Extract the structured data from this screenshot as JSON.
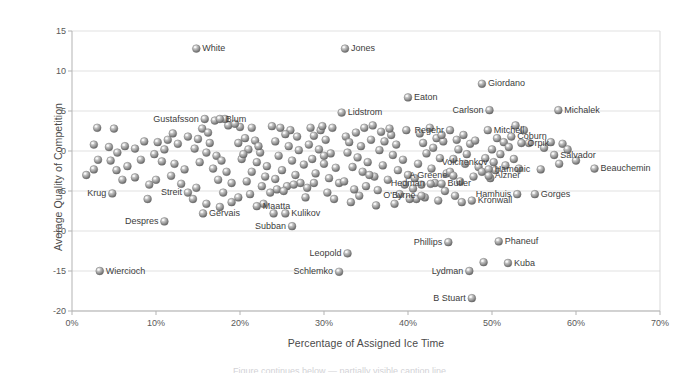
{
  "chart_data": {
    "type": "scatter",
    "title": "",
    "xlabel": "Percentage of Assigned Ice Time",
    "ylabel": "Average Quality of Competition",
    "xlim": [
      0,
      70
    ],
    "ylim": [
      -20,
      15
    ],
    "xtick_labels": [
      "0%",
      "10%",
      "20%",
      "30%",
      "40%",
      "50%",
      "60%",
      "70%"
    ],
    "xtick_values": [
      0,
      10,
      20,
      30,
      40,
      50,
      60,
      70
    ],
    "ytick_labels": [
      "15",
      "10",
      "5",
      "0",
      "-5",
      "-10",
      "-15",
      "-20"
    ],
    "ytick_values": [
      15,
      10,
      5,
      0,
      -5,
      -10,
      -15,
      -20
    ],
    "grid": "horizontal",
    "xaxis_unit": "percent",
    "marker_style": "sphere-gray",
    "legend": "none",
    "labeled_points": [
      {
        "label": "White",
        "x": 14.8,
        "y": 12.8,
        "anchor": "right"
      },
      {
        "label": "Jones",
        "x": 32.5,
        "y": 12.8,
        "anchor": "right"
      },
      {
        "label": "Giordano",
        "x": 48.8,
        "y": 8.4,
        "anchor": "right"
      },
      {
        "label": "Eaton",
        "x": 40.0,
        "y": 6.7,
        "anchor": "right"
      },
      {
        "label": "Michalek",
        "x": 57.9,
        "y": 5.1,
        "anchor": "right"
      },
      {
        "label": "Carlson",
        "x": 49.7,
        "y": 5.1,
        "anchor": "left"
      },
      {
        "label": "Lidstrom",
        "x": 32.1,
        "y": 4.8,
        "anchor": "right"
      },
      {
        "label": "Gustafsson",
        "x": 15.8,
        "y": 4.0,
        "anchor": "left"
      },
      {
        "label": "Blum",
        "x": 17.6,
        "y": 4.0,
        "anchor": "right"
      },
      {
        "label": "Mitchell",
        "x": 49.5,
        "y": 2.6,
        "anchor": "right"
      },
      {
        "label": "Regehr",
        "x": 45.0,
        "y": 2.6,
        "anchor": "left"
      },
      {
        "label": "Coburn",
        "x": 52.3,
        "y": 1.8,
        "anchor": "right"
      },
      {
        "label": "Orpik",
        "x": 53.5,
        "y": 1.0,
        "anchor": "right"
      },
      {
        "label": "Salvador",
        "x": 57.4,
        "y": -0.5,
        "anchor": "right"
      },
      {
        "label": "Volchenkov",
        "x": 50.2,
        "y": -1.4,
        "anchor": "left"
      },
      {
        "label": "Beauchemin",
        "x": 62.2,
        "y": -2.2,
        "anchor": "right"
      },
      {
        "label": "Hamonic",
        "x": 49.6,
        "y": -2.3,
        "anchor": "right"
      },
      {
        "label": "Alzner",
        "x": 49.6,
        "y": -3.1,
        "anchor": "right"
      },
      {
        "label": "A Greene",
        "x": 45.4,
        "y": -3.1,
        "anchor": "left"
      },
      {
        "label": "Butler",
        "x": 44.0,
        "y": -4.1,
        "anchor": "right"
      },
      {
        "label": "Hedman",
        "x": 42.7,
        "y": -4.1,
        "anchor": "left"
      },
      {
        "label": "Hamhuis",
        "x": 53.0,
        "y": -5.4,
        "anchor": "left"
      },
      {
        "label": "Gorges",
        "x": 55.1,
        "y": -5.4,
        "anchor": "right"
      },
      {
        "label": "O'Byrne",
        "x": 41.6,
        "y": -5.6,
        "anchor": "left"
      },
      {
        "label": "Kronwall",
        "x": 47.6,
        "y": -6.2,
        "anchor": "right"
      },
      {
        "label": "Krug",
        "x": 4.8,
        "y": -5.3,
        "anchor": "left"
      },
      {
        "label": "Streit",
        "x": 13.8,
        "y": -5.2,
        "anchor": "left"
      },
      {
        "label": "Maatta",
        "x": 22.0,
        "y": -6.9,
        "anchor": "right"
      },
      {
        "label": "Kulikov",
        "x": 25.4,
        "y": -7.8,
        "anchor": "right"
      },
      {
        "label": "Gervais",
        "x": 15.6,
        "y": -7.8,
        "anchor": "right"
      },
      {
        "label": "Despres",
        "x": 11.0,
        "y": -8.8,
        "anchor": "left"
      },
      {
        "label": "Subban",
        "x": 26.2,
        "y": -9.4,
        "anchor": "left"
      },
      {
        "label": "Phillips",
        "x": 44.8,
        "y": -11.4,
        "anchor": "left"
      },
      {
        "label": "Phaneuf",
        "x": 50.8,
        "y": -11.3,
        "anchor": "right"
      },
      {
        "label": "Leopold",
        "x": 32.8,
        "y": -12.8,
        "anchor": "left"
      },
      {
        "label": "Kuba",
        "x": 51.9,
        "y": -14.0,
        "anchor": "right"
      },
      {
        "label": "Wiercioch",
        "x": 3.3,
        "y": -15.0,
        "anchor": "right"
      },
      {
        "label": "Lydman",
        "x": 47.3,
        "y": -15.0,
        "anchor": "left"
      },
      {
        "label": "Schlemko",
        "x": 31.8,
        "y": -15.1,
        "anchor": "left"
      },
      {
        "label": "B Stuart",
        "x": 47.6,
        "y": -18.4,
        "anchor": "left"
      }
    ],
    "extra_markers": [
      {
        "x": 49.0,
        "y": -13.9
      },
      {
        "x": 24.0,
        "y": -7.8
      }
    ],
    "unlabeled_points": [
      {
        "x": 3.0,
        "y": 2.9
      },
      {
        "x": 5.0,
        "y": 2.8
      },
      {
        "x": 2.6,
        "y": 0.8
      },
      {
        "x": 4.4,
        "y": 0.5
      },
      {
        "x": 6.3,
        "y": 0.6
      },
      {
        "x": 7.5,
        "y": 0.3
      },
      {
        "x": 5.4,
        "y": -0.2
      },
      {
        "x": 3.1,
        "y": -1.1
      },
      {
        "x": 4.6,
        "y": -1.2
      },
      {
        "x": 6.6,
        "y": -1.9
      },
      {
        "x": 8.2,
        "y": -1.1
      },
      {
        "x": 1.7,
        "y": -3.0
      },
      {
        "x": 5.3,
        "y": -2.4
      },
      {
        "x": 7.5,
        "y": -3.3
      },
      {
        "x": 9.2,
        "y": -4.2
      },
      {
        "x": 2.6,
        "y": -2.3
      },
      {
        "x": 6.0,
        "y": -3.6
      },
      {
        "x": 9.8,
        "y": -0.4
      },
      {
        "x": 11.0,
        "y": 0.2
      },
      {
        "x": 10.2,
        "y": 1.1
      },
      {
        "x": 11.4,
        "y": 1.4
      },
      {
        "x": 12.6,
        "y": 0.9
      },
      {
        "x": 10.7,
        "y": -1.3
      },
      {
        "x": 12.2,
        "y": -1.6
      },
      {
        "x": 13.4,
        "y": -2.3
      },
      {
        "x": 11.8,
        "y": -3.1
      },
      {
        "x": 10.0,
        "y": -3.6
      },
      {
        "x": 13.0,
        "y": -4.1
      },
      {
        "x": 14.8,
        "y": -4.6
      },
      {
        "x": 15.5,
        "y": 2.8
      },
      {
        "x": 16.2,
        "y": 2.3
      },
      {
        "x": 15.0,
        "y": 1.5
      },
      {
        "x": 16.4,
        "y": 1.0
      },
      {
        "x": 14.6,
        "y": 0.3
      },
      {
        "x": 16.0,
        "y": -0.2
      },
      {
        "x": 17.2,
        "y": -0.6
      },
      {
        "x": 15.2,
        "y": -1.4
      },
      {
        "x": 17.8,
        "y": -1.2
      },
      {
        "x": 16.8,
        "y": -2.2
      },
      {
        "x": 18.4,
        "y": -2.6
      },
      {
        "x": 17.4,
        "y": -3.6
      },
      {
        "x": 19.0,
        "y": -4.0
      },
      {
        "x": 18.0,
        "y": -5.2
      },
      {
        "x": 19.8,
        "y": -5.8
      },
      {
        "x": 20.6,
        "y": 1.6
      },
      {
        "x": 21.8,
        "y": 1.3
      },
      {
        "x": 19.8,
        "y": 1.0
      },
      {
        "x": 21.0,
        "y": 0.2
      },
      {
        "x": 22.4,
        "y": -0.2
      },
      {
        "x": 20.2,
        "y": -1.0
      },
      {
        "x": 22.0,
        "y": -1.4
      },
      {
        "x": 23.2,
        "y": -1.9
      },
      {
        "x": 21.4,
        "y": -2.6
      },
      {
        "x": 23.0,
        "y": -3.2
      },
      {
        "x": 20.8,
        "y": -3.8
      },
      {
        "x": 22.6,
        "y": -4.4
      },
      {
        "x": 24.4,
        "y": -4.8
      },
      {
        "x": 21.2,
        "y": -5.4
      },
      {
        "x": 23.6,
        "y": -5.2
      },
      {
        "x": 18.6,
        "y": 3.2
      },
      {
        "x": 20.0,
        "y": 3.0
      },
      {
        "x": 21.4,
        "y": 2.9
      },
      {
        "x": 24.8,
        "y": 2.9
      },
      {
        "x": 26.0,
        "y": 2.6
      },
      {
        "x": 25.4,
        "y": 2.1
      },
      {
        "x": 26.8,
        "y": 1.8
      },
      {
        "x": 24.2,
        "y": 1.2
      },
      {
        "x": 25.8,
        "y": 0.6
      },
      {
        "x": 27.0,
        "y": 0.1
      },
      {
        "x": 24.6,
        "y": -0.6
      },
      {
        "x": 26.2,
        "y": -1.2
      },
      {
        "x": 27.6,
        "y": -1.7
      },
      {
        "x": 25.0,
        "y": -2.4
      },
      {
        "x": 26.6,
        "y": -3.0
      },
      {
        "x": 24.2,
        "y": -3.5
      },
      {
        "x": 27.2,
        "y": -4.0
      },
      {
        "x": 25.6,
        "y": -4.4
      },
      {
        "x": 28.4,
        "y": 2.9
      },
      {
        "x": 29.6,
        "y": 2.6
      },
      {
        "x": 28.8,
        "y": 1.9
      },
      {
        "x": 30.2,
        "y": 1.4
      },
      {
        "x": 28.2,
        "y": 0.8
      },
      {
        "x": 29.4,
        "y": 0.2
      },
      {
        "x": 30.8,
        "y": -0.3
      },
      {
        "x": 28.6,
        "y": -1.0
      },
      {
        "x": 30.0,
        "y": -1.6
      },
      {
        "x": 31.4,
        "y": -2.1
      },
      {
        "x": 29.0,
        "y": -2.8
      },
      {
        "x": 30.6,
        "y": -3.4
      },
      {
        "x": 31.8,
        "y": -4.0
      },
      {
        "x": 28.0,
        "y": -4.6
      },
      {
        "x": 30.4,
        "y": -5.2
      },
      {
        "x": 32.6,
        "y": 1.8
      },
      {
        "x": 33.8,
        "y": 2.3
      },
      {
        "x": 34.8,
        "y": 2.9
      },
      {
        "x": 33.0,
        "y": 1.1
      },
      {
        "x": 34.4,
        "y": 0.6
      },
      {
        "x": 35.6,
        "y": 1.4
      },
      {
        "x": 32.8,
        "y": -0.2
      },
      {
        "x": 34.0,
        "y": -0.8
      },
      {
        "x": 35.2,
        "y": -1.4
      },
      {
        "x": 33.4,
        "y": -2.0
      },
      {
        "x": 34.6,
        "y": -2.6
      },
      {
        "x": 36.0,
        "y": -3.2
      },
      {
        "x": 32.4,
        "y": -3.8
      },
      {
        "x": 35.0,
        "y": -4.4
      },
      {
        "x": 36.4,
        "y": -4.9
      },
      {
        "x": 36.8,
        "y": 2.4
      },
      {
        "x": 38.0,
        "y": 2.0
      },
      {
        "x": 37.2,
        "y": 1.2
      },
      {
        "x": 38.6,
        "y": 0.8
      },
      {
        "x": 36.6,
        "y": 0.1
      },
      {
        "x": 38.2,
        "y": -0.5
      },
      {
        "x": 39.4,
        "y": -1.1
      },
      {
        "x": 37.0,
        "y": -1.8
      },
      {
        "x": 38.8,
        "y": -2.4
      },
      {
        "x": 40.0,
        "y": -3.0
      },
      {
        "x": 37.6,
        "y": -3.6
      },
      {
        "x": 39.6,
        "y": -4.2
      },
      {
        "x": 40.6,
        "y": -4.7
      },
      {
        "x": 39.0,
        "y": -5.4
      },
      {
        "x": 41.0,
        "y": -6.0
      },
      {
        "x": 41.4,
        "y": 2.2
      },
      {
        "x": 42.6,
        "y": 2.9
      },
      {
        "x": 43.4,
        "y": 1.6
      },
      {
        "x": 41.8,
        "y": 1.0
      },
      {
        "x": 43.0,
        "y": 0.4
      },
      {
        "x": 44.2,
        "y": 1.2
      },
      {
        "x": 42.2,
        "y": -0.3
      },
      {
        "x": 43.8,
        "y": -0.9
      },
      {
        "x": 41.2,
        "y": -1.6
      },
      {
        "x": 42.8,
        "y": -2.2
      },
      {
        "x": 44.6,
        "y": -2.8
      },
      {
        "x": 40.8,
        "y": -3.4
      },
      {
        "x": 43.2,
        "y": -4.0
      },
      {
        "x": 42.0,
        "y": -5.8
      },
      {
        "x": 43.6,
        "y": -6.2
      },
      {
        "x": 45.8,
        "y": 1.4
      },
      {
        "x": 46.6,
        "y": 2.0
      },
      {
        "x": 47.4,
        "y": 0.9
      },
      {
        "x": 46.0,
        "y": 0.2
      },
      {
        "x": 47.0,
        "y": -0.4
      },
      {
        "x": 48.0,
        "y": 1.3
      },
      {
        "x": 45.4,
        "y": -1.0
      },
      {
        "x": 46.8,
        "y": -1.6
      },
      {
        "x": 48.4,
        "y": -2.0
      },
      {
        "x": 45.0,
        "y": -2.6
      },
      {
        "x": 47.8,
        "y": -3.2
      },
      {
        "x": 46.2,
        "y": -3.8
      },
      {
        "x": 44.4,
        "y": -5.0
      },
      {
        "x": 45.6,
        "y": -5.6
      },
      {
        "x": 46.4,
        "y": -6.4
      },
      {
        "x": 50.6,
        "y": 1.6
      },
      {
        "x": 51.4,
        "y": 1.1
      },
      {
        "x": 52.0,
        "y": 0.5
      },
      {
        "x": 50.0,
        "y": 0.2
      },
      {
        "x": 51.0,
        "y": -0.4
      },
      {
        "x": 52.6,
        "y": -1.0
      },
      {
        "x": 49.2,
        "y": -0.9
      },
      {
        "x": 51.6,
        "y": -1.8
      },
      {
        "x": 53.2,
        "y": -2.2
      },
      {
        "x": 49.8,
        "y": -3.4
      },
      {
        "x": 55.8,
        "y": -2.3
      },
      {
        "x": 54.4,
        "y": 1.0
      },
      {
        "x": 56.2,
        "y": 0.4
      },
      {
        "x": 57.0,
        "y": 1.1
      },
      {
        "x": 58.4,
        "y": 0.9
      },
      {
        "x": 59.0,
        "y": 0.2
      },
      {
        "x": 60.0,
        "y": -1.2
      },
      {
        "x": 58.0,
        "y": -1.6
      },
      {
        "x": 8.6,
        "y": 1.2
      },
      {
        "x": 12.0,
        "y": 2.2
      },
      {
        "x": 13.8,
        "y": 1.8
      },
      {
        "x": 17.0,
        "y": 3.8
      },
      {
        "x": 18.2,
        "y": 4.0
      },
      {
        "x": 19.4,
        "y": 3.4
      },
      {
        "x": 23.8,
        "y": 3.1
      },
      {
        "x": 29.8,
        "y": 3.1
      },
      {
        "x": 31.0,
        "y": 2.9
      },
      {
        "x": 35.8,
        "y": 3.2
      },
      {
        "x": 37.8,
        "y": 2.8
      },
      {
        "x": 39.8,
        "y": 2.6
      },
      {
        "x": 44.0,
        "y": 2.0
      },
      {
        "x": 53.8,
        "y": 2.6
      },
      {
        "x": 52.8,
        "y": 3.2
      },
      {
        "x": 9.0,
        "y": -6.0
      },
      {
        "x": 14.4,
        "y": -6.0
      },
      {
        "x": 16.0,
        "y": -6.6
      },
      {
        "x": 19.0,
        "y": -6.4
      },
      {
        "x": 17.6,
        "y": -7.0
      },
      {
        "x": 22.8,
        "y": -6.6
      },
      {
        "x": 25.2,
        "y": -5.0
      },
      {
        "x": 27.8,
        "y": -5.8
      },
      {
        "x": 31.2,
        "y": -6.0
      },
      {
        "x": 33.2,
        "y": -6.4
      },
      {
        "x": 34.2,
        "y": -5.6
      },
      {
        "x": 36.2,
        "y": -6.8
      },
      {
        "x": 38.4,
        "y": -6.6
      },
      {
        "x": 40.2,
        "y": -6.0
      },
      {
        "x": 41.6,
        "y": -4.2
      },
      {
        "x": 26.4,
        "y": -4.2
      },
      {
        "x": 28.8,
        "y": -4.0
      },
      {
        "x": 33.6,
        "y": -4.8
      },
      {
        "x": 35.4,
        "y": -3.0
      },
      {
        "x": 48.8,
        "y": -2.6
      },
      {
        "x": 50.4,
        "y": -2.4
      },
      {
        "x": 30.0,
        "y": -0.6
      },
      {
        "x": 20.4,
        "y": -0.4
      },
      {
        "x": 22.2,
        "y": 0.6
      }
    ]
  },
  "caption": {
    "cut_text": "Figure continues below — partially visible caption line"
  }
}
